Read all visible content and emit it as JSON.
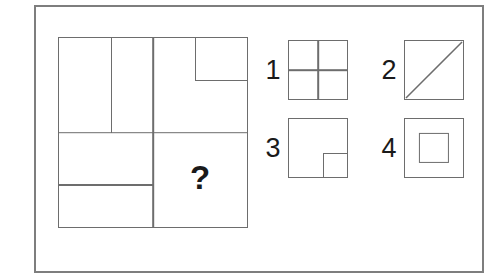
{
  "puzzle": {
    "type": "visual-analogy-matrix",
    "question_mark": "?",
    "matrix": {
      "rows": 2,
      "cols": 2,
      "cells": [
        {
          "position": "top-left",
          "content": "square split by one vertical line into two vertical rectangles"
        },
        {
          "position": "top-right",
          "content": "square with a small square cut into its upper-right corner"
        },
        {
          "position": "bottom-left",
          "content": "square split by one horizontal line into two horizontal rectangles"
        },
        {
          "position": "bottom-right",
          "content": "unknown cell marked with a question mark"
        }
      ]
    }
  },
  "options": [
    {
      "number": "1",
      "shape": "square-quartered",
      "description": "square divided into four equal quadrants"
    },
    {
      "number": "2",
      "shape": "square-diagonal",
      "description": "square with a diagonal line from bottom-left to top-right"
    },
    {
      "number": "3",
      "shape": "square-corner-notch",
      "description": "square with a small square outlined in its bottom-right corner"
    },
    {
      "number": "4",
      "shape": "square-concentric",
      "description": "square with a smaller concentric square centered inside"
    }
  ],
  "colors": {
    "background": "#ffffff",
    "line": "#6d6d6d",
    "frame": "#7e7e7e",
    "text": "#1a1a1a"
  }
}
